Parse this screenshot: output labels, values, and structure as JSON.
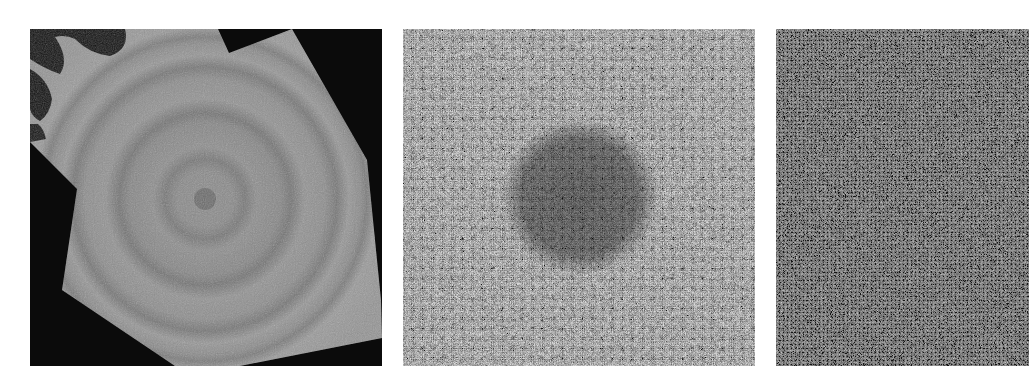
{
  "figure": {
    "background": "#ffffff",
    "panel_count": 3,
    "text_labels": []
  },
  "panels": [
    {
      "id": "a",
      "description": "Grayscale micrograph: polygonal gray sample region on black background with concentric circular rings and a small dark central dot",
      "x": 30,
      "y": 29,
      "width": 352,
      "height": 337,
      "base_gray": "#8a8a8a",
      "background_gray": "#0a0a0a",
      "ring_center": [
        175,
        170
      ],
      "ring_radii": [
        40,
        85,
        130,
        160
      ],
      "center_dot_radius": 11
    },
    {
      "id": "b",
      "description": "High-noise grayscale texture with a faint darker circular blob in the center",
      "x": 403,
      "y": 29,
      "width": 352,
      "height": 337,
      "base_gray": "#7c7c7c",
      "blob_center": [
        177,
        168
      ],
      "blob_radius": 70
    },
    {
      "id": "c",
      "description": "Dense fine-grained granular grayscale texture, cropped at the right edge",
      "x": 776,
      "y": 29,
      "width": 253,
      "height": 337,
      "base_gray": "#6a6a6a"
    }
  ]
}
